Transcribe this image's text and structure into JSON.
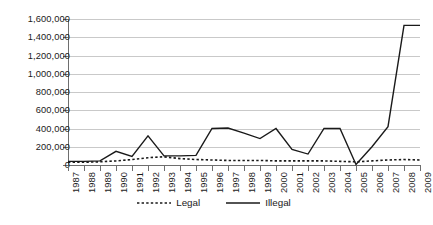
{
  "chart_data": {
    "type": "line",
    "title": "",
    "xlabel": "",
    "ylabel": "",
    "grid": true,
    "legend_position": "bottom-center",
    "ylim": [
      0,
      1600000
    ],
    "ytick_step": 200000,
    "yticks": [
      "1,600,000",
      "1,400,000",
      "1,200,000",
      "1,000,000",
      "800,000",
      "600,000",
      "400,000",
      "200,000",
      "0"
    ],
    "ytick_values": [
      1600000,
      1400000,
      1200000,
      1000000,
      800000,
      600000,
      400000,
      200000,
      0
    ],
    "categories": [
      "1987",
      "1988",
      "1989",
      "1990",
      "1991",
      "1992",
      "1993",
      "1994",
      "1995",
      "1996",
      "1997",
      "1998",
      "1999",
      "2000",
      "2001",
      "2002",
      "2003",
      "2004",
      "2005",
      "2006",
      "2007",
      "2008",
      "2009"
    ],
    "series": [
      {
        "name": "Legal",
        "style": "dotted",
        "color": "#1a1a1a",
        "values": [
          30000,
          30000,
          35000,
          45000,
          60000,
          80000,
          90000,
          70000,
          60000,
          55000,
          50000,
          50000,
          50000,
          45000,
          45000,
          45000,
          45000,
          40000,
          35000,
          45000,
          55000,
          60000,
          55000
        ]
      },
      {
        "name": "Illegal",
        "style": "solid",
        "color": "#1a1a1a",
        "values": [
          40000,
          40000,
          45000,
          150000,
          95000,
          320000,
          100000,
          100000,
          105000,
          400000,
          405000,
          350000,
          290000,
          400000,
          170000,
          120000,
          400000,
          400000,
          5000,
          200000,
          420000,
          1530000,
          1530000
        ]
      }
    ]
  },
  "legend": {
    "items": [
      {
        "label": "Legal",
        "style": "dotted"
      },
      {
        "label": "Illegal",
        "style": "solid"
      }
    ]
  },
  "colors": {
    "series_line": "#1a1a1a",
    "gridline": "#c9c9c9",
    "axis": "#6e6e6e",
    "background": "#ffffff",
    "text": "#1a1a1a"
  }
}
